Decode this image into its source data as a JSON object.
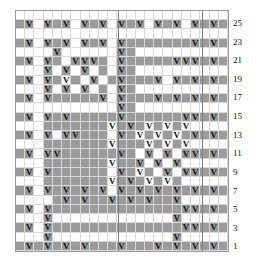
{
  "chart_data": {
    "type": "heatmap",
    "title": "",
    "xlabel": "",
    "ylabel": "",
    "columns": 23,
    "rows": 26,
    "legend": {
      "fill_color": "#9b9b9b",
      "empty_color": "#ffffff",
      "grid_line_color": "#d9d9d9",
      "border_color": "#9a9a9a",
      "symbol": "V"
    },
    "row_labels": [
      "25",
      "23",
      "21",
      "19",
      "17",
      "15",
      "13",
      "11",
      "9",
      "7",
      "5",
      "3",
      "1"
    ],
    "row_label_side": "right",
    "row_label_order": "top-to-bottom",
    "section_divider_columns": [
      11,
      20
    ],
    "fill_grid": [
      [
        0,
        0,
        0,
        0,
        0,
        0,
        0,
        0,
        0,
        0,
        0,
        0,
        0,
        0,
        0,
        0,
        0,
        0,
        0,
        0,
        0,
        0,
        0
      ],
      [
        1,
        1,
        0,
        1,
        1,
        1,
        0,
        1,
        1,
        1,
        0,
        1,
        1,
        1,
        0,
        1,
        1,
        1,
        0,
        1,
        1,
        1,
        1
      ],
      [
        0,
        0,
        0,
        0,
        0,
        0,
        0,
        0,
        0,
        0,
        0,
        0,
        0,
        0,
        0,
        0,
        0,
        0,
        0,
        0,
        0,
        0,
        0
      ],
      [
        1,
        1,
        0,
        1,
        1,
        1,
        0,
        1,
        1,
        1,
        0,
        1,
        1,
        1,
        1,
        1,
        1,
        1,
        1,
        1,
        1,
        1,
        1
      ],
      [
        0,
        0,
        0,
        0,
        1,
        0,
        0,
        0,
        0,
        0,
        0,
        1,
        1,
        0,
        0,
        0,
        0,
        0,
        0,
        0,
        0,
        0,
        0
      ],
      [
        1,
        1,
        0,
        1,
        1,
        0,
        1,
        1,
        1,
        1,
        0,
        1,
        1,
        1,
        1,
        1,
        1,
        1,
        1,
        1,
        1,
        1,
        1
      ],
      [
        0,
        0,
        0,
        1,
        0,
        1,
        0,
        1,
        0,
        1,
        0,
        1,
        1,
        0,
        0,
        0,
        0,
        0,
        0,
        0,
        0,
        0,
        0
      ],
      [
        1,
        1,
        0,
        1,
        1,
        0,
        1,
        0,
        1,
        0,
        1,
        1,
        1,
        1,
        1,
        1,
        0,
        1,
        1,
        1,
        1,
        1,
        1
      ],
      [
        0,
        0,
        0,
        1,
        0,
        1,
        0,
        1,
        0,
        1,
        0,
        1,
        1,
        0,
        0,
        0,
        0,
        0,
        0,
        0,
        0,
        0,
        0
      ],
      [
        1,
        1,
        0,
        1,
        1,
        1,
        1,
        1,
        1,
        1,
        0,
        1,
        1,
        1,
        1,
        1,
        1,
        1,
        1,
        1,
        1,
        1,
        1
      ],
      [
        0,
        0,
        0,
        0,
        0,
        0,
        0,
        0,
        0,
        0,
        0,
        1,
        1,
        0,
        0,
        0,
        0,
        0,
        0,
        0,
        0,
        0,
        0
      ],
      [
        1,
        1,
        0,
        1,
        1,
        1,
        1,
        1,
        1,
        1,
        1,
        1,
        1,
        1,
        1,
        1,
        1,
        1,
        1,
        1,
        1,
        1,
        1
      ],
      [
        0,
        0,
        0,
        1,
        1,
        1,
        1,
        1,
        1,
        1,
        0,
        1,
        1,
        1,
        0,
        1,
        0,
        1,
        0,
        0,
        0,
        0,
        0
      ],
      [
        1,
        1,
        0,
        1,
        0,
        1,
        1,
        1,
        1,
        1,
        0,
        1,
        1,
        0,
        1,
        0,
        1,
        0,
        1,
        1,
        1,
        1,
        1
      ],
      [
        0,
        0,
        0,
        1,
        1,
        1,
        1,
        1,
        1,
        1,
        0,
        1,
        1,
        1,
        0,
        1,
        0,
        1,
        0,
        0,
        0,
        0,
        0
      ],
      [
        1,
        1,
        0,
        1,
        1,
        1,
        1,
        1,
        1,
        1,
        1,
        1,
        1,
        0,
        1,
        0,
        1,
        0,
        1,
        1,
        1,
        1,
        1
      ],
      [
        0,
        0,
        0,
        1,
        1,
        1,
        1,
        1,
        1,
        1,
        0,
        1,
        1,
        1,
        0,
        1,
        0,
        1,
        0,
        0,
        0,
        0,
        0
      ],
      [
        1,
        1,
        0,
        1,
        1,
        1,
        1,
        1,
        1,
        1,
        0,
        1,
        1,
        0,
        1,
        0,
        1,
        0,
        1,
        1,
        1,
        1,
        1
      ],
      [
        0,
        0,
        0,
        1,
        1,
        1,
        1,
        1,
        1,
        1,
        0,
        1,
        1,
        1,
        0,
        1,
        0,
        1,
        0,
        0,
        0,
        0,
        0
      ],
      [
        1,
        1,
        0,
        1,
        1,
        1,
        1,
        1,
        1,
        1,
        0,
        1,
        1,
        1,
        1,
        1,
        1,
        1,
        1,
        1,
        1,
        1,
        1
      ],
      [
        0,
        0,
        0,
        0,
        1,
        1,
        1,
        1,
        1,
        1,
        1,
        1,
        1,
        1,
        1,
        1,
        1,
        1,
        0,
        0,
        0,
        0,
        0
      ],
      [
        1,
        1,
        0,
        1,
        1,
        1,
        1,
        1,
        1,
        1,
        1,
        1,
        1,
        1,
        1,
        1,
        1,
        1,
        1,
        1,
        1,
        1,
        1
      ],
      [
        0,
        0,
        0,
        1,
        0,
        0,
        0,
        0,
        0,
        0,
        0,
        0,
        0,
        0,
        0,
        0,
        0,
        1,
        0,
        0,
        0,
        0,
        0
      ],
      [
        1,
        1,
        0,
        1,
        1,
        1,
        1,
        1,
        1,
        1,
        1,
        1,
        1,
        1,
        1,
        1,
        1,
        1,
        1,
        1,
        1,
        1,
        1
      ],
      [
        0,
        0,
        0,
        1,
        0,
        0,
        0,
        0,
        0,
        0,
        0,
        0,
        0,
        0,
        0,
        0,
        0,
        1,
        0,
        0,
        0,
        0,
        0
      ],
      [
        1,
        1,
        1,
        1,
        1,
        1,
        1,
        1,
        1,
        1,
        1,
        1,
        1,
        1,
        1,
        1,
        1,
        1,
        1,
        1,
        1,
        1,
        1
      ]
    ],
    "symbol_grid": [
      [
        0,
        0,
        0,
        0,
        0,
        0,
        0,
        0,
        0,
        0,
        0,
        0,
        0,
        0,
        0,
        0,
        0,
        0,
        0,
        0,
        0,
        0,
        0
      ],
      [
        0,
        1,
        0,
        1,
        0,
        1,
        0,
        1,
        0,
        1,
        0,
        1,
        0,
        1,
        0,
        1,
        0,
        1,
        0,
        1,
        0,
        1,
        0
      ],
      [
        0,
        0,
        0,
        0,
        0,
        0,
        0,
        0,
        0,
        0,
        0,
        0,
        0,
        0,
        0,
        0,
        0,
        0,
        0,
        0,
        0,
        0,
        0
      ],
      [
        0,
        1,
        0,
        1,
        0,
        1,
        0,
        1,
        0,
        1,
        0,
        1,
        0,
        0,
        0,
        0,
        0,
        0,
        0,
        1,
        0,
        1,
        0
      ],
      [
        0,
        0,
        0,
        0,
        1,
        0,
        0,
        0,
        0,
        0,
        0,
        1,
        0,
        0,
        0,
        0,
        0,
        0,
        0,
        0,
        0,
        0,
        0
      ],
      [
        0,
        1,
        0,
        1,
        0,
        0,
        1,
        1,
        1,
        0,
        0,
        1,
        0,
        0,
        0,
        0,
        0,
        1,
        1,
        1,
        0,
        1,
        0
      ],
      [
        0,
        0,
        0,
        1,
        0,
        1,
        0,
        1,
        0,
        0,
        0,
        1,
        0,
        0,
        0,
        0,
        0,
        0,
        0,
        0,
        0,
        0,
        0
      ],
      [
        0,
        1,
        0,
        1,
        0,
        1,
        0,
        0,
        1,
        0,
        0,
        1,
        0,
        0,
        0,
        1,
        0,
        1,
        0,
        1,
        0,
        1,
        0
      ],
      [
        0,
        0,
        0,
        1,
        0,
        1,
        0,
        1,
        0,
        0,
        0,
        1,
        0,
        0,
        0,
        0,
        0,
        0,
        0,
        0,
        0,
        0,
        0
      ],
      [
        0,
        1,
        0,
        1,
        0,
        0,
        0,
        0,
        0,
        1,
        0,
        1,
        0,
        0,
        0,
        1,
        0,
        1,
        0,
        1,
        0,
        1,
        0
      ],
      [
        0,
        0,
        0,
        0,
        0,
        0,
        0,
        0,
        0,
        0,
        0,
        1,
        0,
        0,
        0,
        0,
        0,
        0,
        0,
        0,
        0,
        0,
        0
      ],
      [
        0,
        1,
        0,
        1,
        0,
        1,
        0,
        0,
        0,
        0,
        0,
        1,
        0,
        0,
        0,
        0,
        0,
        0,
        1,
        1,
        0,
        1,
        0
      ],
      [
        0,
        0,
        0,
        0,
        0,
        0,
        0,
        0,
        0,
        0,
        1,
        0,
        1,
        0,
        1,
        0,
        1,
        0,
        1,
        0,
        0,
        0,
        0
      ],
      [
        0,
        1,
        0,
        1,
        0,
        1,
        1,
        0,
        0,
        0,
        0,
        1,
        0,
        1,
        0,
        1,
        0,
        1,
        0,
        1,
        0,
        1,
        0
      ],
      [
        0,
        0,
        0,
        0,
        0,
        0,
        0,
        0,
        0,
        0,
        1,
        0,
        0,
        0,
        1,
        0,
        1,
        0,
        1,
        0,
        0,
        0,
        0
      ],
      [
        0,
        1,
        0,
        1,
        1,
        0,
        0,
        0,
        0,
        0,
        0,
        1,
        0,
        0,
        1,
        0,
        1,
        0,
        1,
        1,
        0,
        1,
        0
      ],
      [
        0,
        0,
        0,
        0,
        0,
        0,
        0,
        0,
        0,
        0,
        1,
        0,
        0,
        1,
        0,
        1,
        0,
        1,
        0,
        0,
        0,
        0,
        0
      ],
      [
        0,
        1,
        0,
        1,
        0,
        0,
        0,
        0,
        0,
        0,
        0,
        1,
        0,
        1,
        0,
        0,
        1,
        0,
        1,
        1,
        0,
        1,
        0
      ],
      [
        0,
        0,
        0,
        0,
        0,
        0,
        0,
        0,
        0,
        0,
        1,
        0,
        1,
        0,
        1,
        0,
        1,
        0,
        0,
        0,
        0,
        0,
        0
      ],
      [
        0,
        1,
        0,
        1,
        0,
        1,
        0,
        1,
        0,
        1,
        0,
        1,
        0,
        1,
        0,
        1,
        0,
        1,
        0,
        1,
        0,
        1,
        0
      ],
      [
        0,
        0,
        0,
        0,
        0,
        1,
        0,
        1,
        0,
        0,
        1,
        0,
        1,
        0,
        1,
        0,
        0,
        1,
        0,
        0,
        0,
        0,
        0
      ],
      [
        0,
        1,
        0,
        1,
        0,
        0,
        0,
        0,
        0,
        0,
        0,
        0,
        0,
        0,
        0,
        0,
        0,
        0,
        1,
        1,
        0,
        1,
        0
      ],
      [
        0,
        0,
        0,
        1,
        0,
        0,
        0,
        0,
        0,
        0,
        0,
        0,
        0,
        0,
        0,
        0,
        0,
        1,
        0,
        0,
        0,
        0,
        0
      ],
      [
        0,
        1,
        0,
        1,
        0,
        0,
        0,
        0,
        0,
        0,
        0,
        0,
        0,
        0,
        0,
        0,
        0,
        0,
        1,
        1,
        0,
        1,
        0
      ],
      [
        0,
        0,
        0,
        1,
        0,
        0,
        0,
        0,
        0,
        0,
        0,
        0,
        0,
        0,
        0,
        0,
        0,
        1,
        0,
        0,
        0,
        0,
        0
      ],
      [
        0,
        1,
        0,
        1,
        0,
        1,
        0,
        1,
        0,
        0,
        0,
        1,
        0,
        0,
        0,
        1,
        0,
        1,
        0,
        1,
        0,
        1,
        0
      ]
    ]
  }
}
